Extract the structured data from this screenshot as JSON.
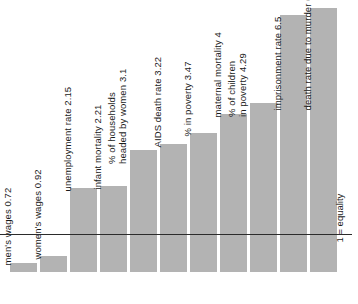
{
  "chart_data": {
    "type": "bar",
    "title": "",
    "subtitle": "",
    "xlabel": "",
    "ylabel": "",
    "orientation": "vertical",
    "grid": false,
    "legend": false,
    "reference_line": {
      "value": 1,
      "label": "1 = equality",
      "orientation": "horizontal"
    },
    "categories": [
      "men's wages",
      "women's wages",
      "unemployment rate",
      "infant mortality",
      "% of households headed by women",
      "AIDS death rate",
      "% in poverty",
      "maternal mortality",
      "% of children in poverty",
      "imprisonment rate",
      "death rate due to murder"
    ],
    "values": [
      0.72,
      0.92,
      2.15,
      2.21,
      3.1,
      3.22,
      3.47,
      4,
      4.29,
      6.5,
      6.76
    ],
    "bar_labels": [
      "men's wages 0.72",
      "women's wages 0.92",
      "unemployment rate 2.15",
      "infant mortality 2.21",
      "% of households\nheaded by women 3.1",
      "AIDS death rate 3.22",
      "% in poverty 3.47",
      "maternal mortality 4",
      "% of children\nin poverty 4.29",
      "imprisonment rate 6.5",
      "death rate due to murder 6.76"
    ],
    "colors": {
      "bar_fill": "#b3b3b3",
      "reference_line": "#2b2b2b",
      "text": "#1a1a1a",
      "background": "#ffffff"
    }
  },
  "geometry": {
    "bars": [
      {
        "x": 10,
        "top": 263,
        "bottom": 272,
        "width": 27,
        "label_x": 13,
        "label_y": 255,
        "label_lines": 1
      },
      {
        "x": 40,
        "top": 256,
        "bottom": 272,
        "width": 27,
        "label_x": 43,
        "label_y": 249,
        "label_lines": 1
      },
      {
        "x": 70,
        "top": 188,
        "bottom": 272,
        "width": 27,
        "label_x": 73,
        "label_y": 181,
        "label_lines": 1
      },
      {
        "x": 100,
        "top": 186,
        "bottom": 272,
        "width": 27,
        "label_x": 103,
        "label_y": 179,
        "label_lines": 1
      },
      {
        "x": 130,
        "top": 150,
        "bottom": 272,
        "width": 27,
        "label_x": 128,
        "label_y": 143,
        "label_lines": 2
      },
      {
        "x": 160,
        "top": 144,
        "bottom": 272,
        "width": 27,
        "label_x": 163,
        "label_y": 137,
        "label_lines": 1
      },
      {
        "x": 190,
        "top": 133,
        "bottom": 272,
        "width": 27,
        "label_x": 193,
        "label_y": 126,
        "label_lines": 1
      },
      {
        "x": 220,
        "top": 114,
        "bottom": 272,
        "width": 27,
        "label_x": 223,
        "label_y": 107,
        "label_lines": 1
      },
      {
        "x": 250,
        "top": 103,
        "bottom": 272,
        "width": 27,
        "label_x": 248,
        "label_y": 96,
        "label_lines": 2
      },
      {
        "x": 280,
        "top": 15,
        "bottom": 272,
        "width": 27,
        "label_x": 283,
        "label_y": 100,
        "label_lines": 1
      },
      {
        "x": 310,
        "top": 8,
        "bottom": 272,
        "width": 27,
        "label_x": 313,
        "label_y": 100,
        "label_lines": 1
      }
    ],
    "equality_line": {
      "y": 234,
      "x": 0,
      "width": 352
    },
    "equality_note": {
      "x": 345,
      "y": 232
    }
  }
}
